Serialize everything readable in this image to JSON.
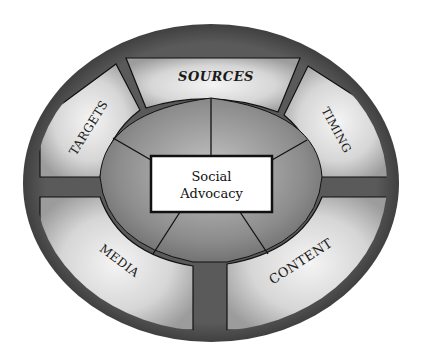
{
  "diagram": {
    "center": {
      "line1": "Social",
      "line2": "Advocacy"
    },
    "segments": [
      {
        "id": "sources",
        "label": "SOURCES"
      },
      {
        "id": "timing",
        "label": "TIMING"
      },
      {
        "id": "content",
        "label": "CONTENT"
      },
      {
        "id": "media",
        "label": "MEDIA"
      },
      {
        "id": "targets",
        "label": "TARGETS"
      }
    ]
  },
  "colors": {
    "outer_ring": "#3a3a3a",
    "segment_fill_light": "#ededed",
    "segment_fill_dark": "#9a9a9a",
    "inner_disc": "#8a8a8a",
    "center_box": "#ffffff",
    "outline": "#111111"
  }
}
